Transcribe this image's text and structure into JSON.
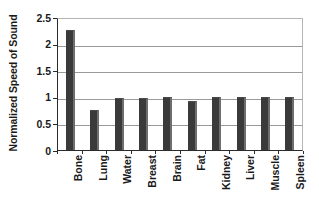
{
  "chart_data": {
    "type": "bar",
    "title": "",
    "xlabel": "",
    "ylabel": "Normalized Speed of Sound",
    "categories": [
      "Bone",
      "Lung",
      "Water",
      "Breast",
      "Brain",
      "Fat",
      "Kidney",
      "Liver",
      "Muscle",
      "Spleen"
    ],
    "values": [
      2.25,
      0.76,
      0.97,
      0.97,
      1.0,
      0.93,
      1.0,
      1.0,
      1.0,
      1.0
    ],
    "ylim": [
      0,
      2.5
    ],
    "yticks": [
      "0",
      "0.5",
      "1",
      "1.5",
      "2",
      "2.5"
    ],
    "ytick_values": [
      0,
      0.5,
      1,
      1.5,
      2,
      2.5
    ],
    "grid": "horizontal",
    "legend": "none",
    "series_name": "Normalized Speed of Sound",
    "bar_color": "#3a3a3a",
    "grid_color": "#9a9a9a",
    "axis_color": "#2b2b2b"
  }
}
